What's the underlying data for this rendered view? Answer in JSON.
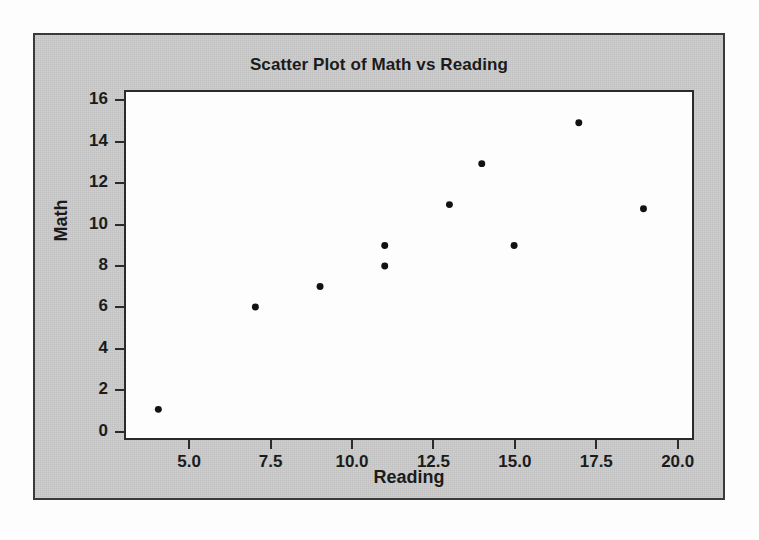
{
  "figure": {
    "title": "Scatter Plot of Math vs Reading",
    "background_color": "#c9c9c9",
    "plot_background_color": "#fdfdfd",
    "border_color": "#3a3a3a",
    "point_color": "#121212"
  },
  "chart_data": {
    "type": "scatter",
    "title": "Scatter Plot of Math vs Reading",
    "xlabel": "Reading",
    "ylabel": "Math",
    "xlim": [
      3.0,
      20.5
    ],
    "ylim": [
      -0.4,
      16.5
    ],
    "xticks": [
      5.0,
      7.5,
      10.0,
      12.5,
      15.0,
      17.5,
      20.0
    ],
    "xtick_labels": [
      "5.0",
      "7.5",
      "10.0",
      "12.5",
      "15.0",
      "17.5",
      "20.0"
    ],
    "yticks": [
      0,
      2,
      4,
      6,
      8,
      10,
      12,
      14,
      16
    ],
    "ytick_labels": [
      "0",
      "2",
      "4",
      "6",
      "8",
      "10",
      "12",
      "14",
      "16"
    ],
    "grid": false,
    "legend": null,
    "marker": "circle",
    "marker_size": 7,
    "series": [
      {
        "name": "Math vs Reading",
        "points": [
          {
            "x": 4,
            "y": 1
          },
          {
            "x": 7,
            "y": 6
          },
          {
            "x": 9,
            "y": 7
          },
          {
            "x": 11,
            "y": 9
          },
          {
            "x": 11,
            "y": 8
          },
          {
            "x": 13,
            "y": 11
          },
          {
            "x": 14,
            "y": 13
          },
          {
            "x": 15,
            "y": 9
          },
          {
            "x": 17,
            "y": 15
          },
          {
            "x": 19,
            "y": 10.8
          }
        ]
      }
    ]
  }
}
